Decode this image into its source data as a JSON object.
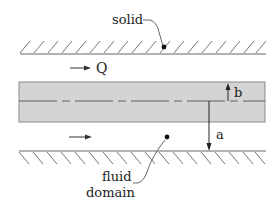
{
  "diagram": {
    "labels": {
      "solid": "solid",
      "flow": "Q",
      "inner_half_width": "b",
      "outer_distance": "a",
      "fluid_line1": "fluid",
      "fluid_line2": "domain"
    },
    "colors": {
      "line": "#555555",
      "band_fill": "#d4d4d4",
      "band_stroke": "#8a8a8a",
      "text": "#222222"
    }
  }
}
